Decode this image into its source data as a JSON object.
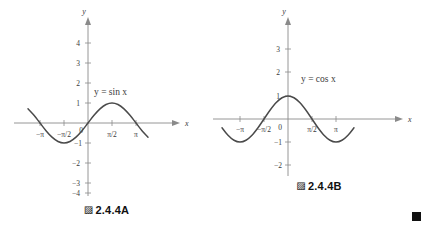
{
  "page": {
    "background_color": "#ffffff",
    "curve_color": "#4a4a4a",
    "axis_color": "#8a8a8a",
    "text_color": "#3a3a3a"
  },
  "figures": [
    {
      "id": "A",
      "caption_mark": "▨",
      "caption": "2.4.4A",
      "equation_label": "y = sin x",
      "x_axis_name": "x",
      "y_axis_name": "y",
      "x_ticks": [
        "−π",
        "−π/2",
        "π/2",
        "π"
      ],
      "y_ticks": [
        "4",
        "3",
        "2",
        "1",
        "0",
        "−1",
        "−2",
        "−3",
        "−4"
      ],
      "chart_data": {
        "type": "line",
        "title": "",
        "xlabel": "x",
        "ylabel": "y",
        "function": "y = sin x",
        "xlim": [
          -3.9269908,
          3.9269908
        ],
        "ylim": [
          -4.6,
          4.6
        ],
        "grid": false,
        "legend": "none",
        "annotations": [
          "y = sin x"
        ],
        "xtick_labels": [
          "−π",
          "−π/2",
          "π/2",
          "π"
        ],
        "xtick_values": [
          -3.14159,
          -1.5708,
          1.5708,
          3.14159
        ],
        "ytick_labels": [
          "4",
          "3",
          "2",
          "1",
          "0",
          "−1",
          "−2",
          "−3",
          "−4"
        ],
        "ytick_values": [
          4,
          3,
          2,
          1,
          0,
          -1,
          -2,
          -3,
          -4
        ],
        "x": [
          -3.9269908,
          -3.5342917,
          -3.1415927,
          -2.7488936,
          -2.3561945,
          -1.9634954,
          -1.5707963,
          -1.1780972,
          -0.7853982,
          -0.3926991,
          0,
          0.3926991,
          0.7853982,
          1.1780972,
          1.5707963,
          1.9634954,
          2.3561945,
          2.7488936,
          3.1415927,
          3.5342917,
          3.9269908
        ],
        "y": [
          0.7071068,
          0.3826834,
          0,
          -0.3826834,
          -0.7071068,
          -0.9238795,
          -1,
          -0.9238795,
          -0.7071068,
          -0.3826834,
          0,
          0.3826834,
          0.7071068,
          0.9238795,
          1,
          0.9238795,
          0.7071068,
          0.3826834,
          0,
          -0.3826834,
          -0.7071068
        ]
      }
    },
    {
      "id": "B",
      "caption_mark": "▨",
      "caption": "2.4.4B",
      "equation_label": "y = cos x",
      "x_axis_name": "x",
      "y_axis_name": "y",
      "x_ticks": [
        "−π",
        "−π/2",
        "0",
        "π/2",
        "π"
      ],
      "y_ticks": [
        "3",
        "2",
        "1",
        "0",
        "−1",
        "−2"
      ],
      "chart_data": {
        "type": "line",
        "title": "",
        "xlabel": "x",
        "ylabel": "y",
        "function": "y = cos x",
        "xlim": [
          -4.3196899,
          4.3196899
        ],
        "ylim": [
          -2.6,
          3.6
        ],
        "grid": false,
        "legend": "none",
        "annotations": [
          "y = cos x"
        ],
        "xtick_labels": [
          "−π",
          "−π/2",
          "0",
          "π/2",
          "π"
        ],
        "xtick_values": [
          -3.14159,
          -1.5708,
          0,
          1.5708,
          3.14159
        ],
        "ytick_labels": [
          "3",
          "2",
          "1",
          "0",
          "−1",
          "−2"
        ],
        "ytick_values": [
          3,
          2,
          1,
          0,
          -1,
          -2
        ],
        "x": [
          -4.3196899,
          -3.9269908,
          -3.5342917,
          -3.1415927,
          -2.7488936,
          -2.3561945,
          -1.9634954,
          -1.5707963,
          -1.1780972,
          -0.7853982,
          -0.3926991,
          0,
          0.3926991,
          0.7853982,
          1.1780972,
          1.5707963,
          1.9634954,
          2.3561945,
          2.7488936,
          3.1415927,
          3.5342917,
          3.9269908,
          4.3196899
        ],
        "y": [
          -0.3826834,
          -0.7071068,
          -0.9238795,
          -1,
          -0.9238795,
          -0.7071068,
          -0.3826834,
          0,
          0.3826834,
          0.7071068,
          0.9238795,
          1,
          0.9238795,
          0.7071068,
          0.3826834,
          0,
          -0.3826834,
          -0.7071068,
          -0.9238795,
          -1,
          -0.9238795,
          -0.7071068,
          -0.3826834
        ]
      }
    }
  ]
}
